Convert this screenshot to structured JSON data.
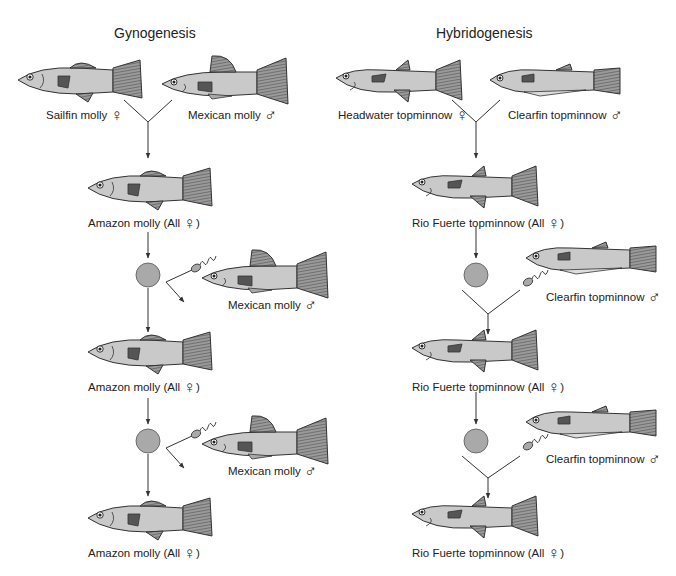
{
  "panels": [
    {
      "title": "Gynogenesis",
      "parents": [
        {
          "label": "Sailfin molly",
          "sex": "♀"
        },
        {
          "label": "Mexican molly",
          "sex": "♂"
        }
      ],
      "generations": [
        {
          "label": "Amazon molly (All",
          "sex": "♀",
          "close": ")"
        },
        {
          "label": "Amazon molly (All",
          "sex": "♀",
          "close": ")"
        },
        {
          "label": "Amazon molly (All",
          "sex": "♀",
          "close": ")"
        }
      ],
      "donors": [
        {
          "label": "Mexican molly",
          "sex": "♂"
        },
        {
          "label": "Mexican molly",
          "sex": "♂"
        }
      ]
    },
    {
      "title": "Hybridogenesis",
      "parents": [
        {
          "label": "Headwater topminnow",
          "sex": "♀"
        },
        {
          "label": "Clearfin topminnow",
          "sex": "♂"
        }
      ],
      "generations": [
        {
          "label": "Rio Fuerte topminnow (All",
          "sex": "♀",
          "close": ")"
        },
        {
          "label": "Rio Fuerte topminnow (All",
          "sex": "♀",
          "close": ")"
        },
        {
          "label": "Rio Fuerte topminnow (All",
          "sex": "♀",
          "close": ")"
        }
      ],
      "donors": [
        {
          "label": "Clearfin topminnow",
          "sex": "♂"
        },
        {
          "label": "Clearfin topminnow",
          "sex": "♂"
        }
      ]
    }
  ],
  "colors": {
    "fish_body": "#c9c9c9",
    "fin": "#8a8a8a",
    "egg": "#a9a9a9",
    "line": "#333333"
  }
}
